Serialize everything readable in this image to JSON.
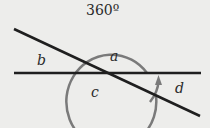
{
  "diagram": {
    "title_label": "360º",
    "angle_labels": {
      "a": "a",
      "b": "b",
      "c": "c",
      "d": "d"
    },
    "colors": {
      "lines": "#1f1f1f",
      "arc": "#7a7a7a",
      "background": "#ededeb"
    }
  }
}
